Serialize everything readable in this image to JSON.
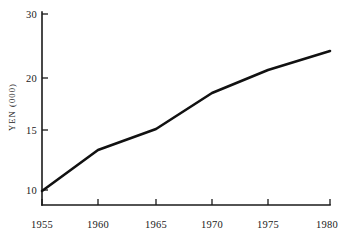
{
  "chart_data": {
    "type": "line",
    "title": "",
    "xlabel": "",
    "ylabel": "YEN (000)",
    "grid": false,
    "legend": "none",
    "x": [
      1955,
      1960,
      1965,
      1970,
      1975,
      1980
    ],
    "categories": [
      "1955",
      "1960",
      "1965",
      "1970",
      "1975",
      "1980"
    ],
    "values": [
      9.8,
      13.5,
      15.1,
      18.6,
      20.9,
      22.2
    ],
    "series": [
      {
        "name": "YEN (000)",
        "values": [
          9.8,
          13.5,
          15.1,
          18.6,
          20.9,
          22.2
        ],
        "color": "#111111"
      }
    ],
    "xlim": [
      1955,
      1980
    ],
    "ylim": [
      10,
      30
    ],
    "y_ticks": [
      10,
      15,
      20,
      30
    ],
    "y_tick_labels": [
      "10",
      "15",
      "20",
      "30"
    ],
    "x_ticks": [
      1955,
      1960,
      1965,
      1970,
      1975,
      1980
    ],
    "x_tick_labels": [
      "1955",
      "1960",
      "1965",
      "1970",
      "1975",
      "1980"
    ]
  },
  "axes": {
    "y_label_text": "YEN (000)",
    "y_ticks": [
      {
        "label": "30",
        "py": 14
      },
      {
        "label": "20",
        "py": 78
      },
      {
        "label": "15",
        "py": 130
      },
      {
        "label": "10",
        "py": 190
      }
    ],
    "x_ticks": [
      {
        "label": "1955",
        "px": 42
      },
      {
        "label": "1960",
        "px": 98
      },
      {
        "label": "1965",
        "px": 156
      },
      {
        "label": "1970",
        "px": 212
      },
      {
        "label": "1975",
        "px": 268
      },
      {
        "label": "1980",
        "px": 327
      }
    ],
    "points": [
      {
        "px": 42,
        "py": 191
      },
      {
        "px": 98,
        "py": 150
      },
      {
        "px": 156,
        "py": 129
      },
      {
        "px": 212,
        "py": 93
      },
      {
        "px": 268,
        "py": 70
      },
      {
        "px": 330,
        "py": 51
      }
    ]
  },
  "colors": {
    "background": "#ffffff",
    "ink": "#1a1a1a",
    "series": "#111111"
  }
}
